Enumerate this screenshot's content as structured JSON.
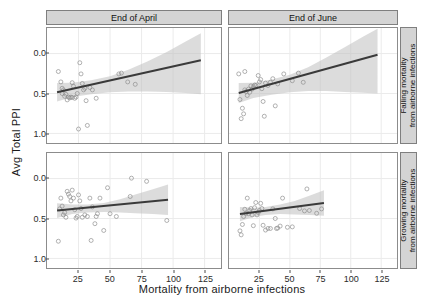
{
  "chart_data": {
    "type": "scatter",
    "title": "",
    "xlabel": "Mortality from airborne infections",
    "ylabel": "Avg Total PPI",
    "xlim": [
      0,
      138
    ],
    "ylim": [
      -0.12,
      1.32
    ],
    "xticks": [
      25,
      50,
      75,
      100,
      125
    ],
    "yticks": [
      "0.0",
      "0.5",
      "1.0"
    ],
    "ytick_values": [
      0.0,
      0.5,
      1.0
    ],
    "grid": true,
    "legend": "none",
    "facet_layout": "2x2",
    "col_facets": [
      "End of April",
      "End of June"
    ],
    "row_facets": [
      "Falling mortality from airborne infections",
      "Growing mortality from airborne infections"
    ],
    "marker": {
      "shape": "circle",
      "color": "#8c8c8c",
      "size": 2,
      "alpha": 0.75
    },
    "fit_line": {
      "color": "#3a3a3a",
      "width": 2,
      "method": "lm"
    },
    "ribbon": {
      "color": "#bfbfbf",
      "alpha": 0.55,
      "label": "95% CI"
    },
    "panels": [
      {
        "id": "april-falling",
        "col": "End of April",
        "row": "Falling mortality from airborne infections",
        "fit": {
          "x0": 8,
          "y0": 0.515,
          "x1": 122,
          "y1": 0.915
        },
        "ci": {
          "x": [
            8,
            20,
            35,
            50,
            65,
            80,
            95,
            110,
            122
          ],
          "lo": [
            0.4,
            0.455,
            0.49,
            0.515,
            0.525,
            0.525,
            0.52,
            0.505,
            0.49
          ],
          "hi": [
            0.63,
            0.635,
            0.665,
            0.715,
            0.8,
            0.905,
            1.02,
            1.15,
            1.255
          ]
        },
        "points": [
          [
            9,
            0.775
          ],
          [
            11,
            0.645
          ],
          [
            12,
            0.565
          ],
          [
            12,
            0.5
          ],
          [
            13,
            0.545
          ],
          [
            14,
            0.465
          ],
          [
            15,
            0.49
          ],
          [
            16,
            0.42
          ],
          [
            17,
            0.455
          ],
          [
            18,
            0.445
          ],
          [
            19,
            0.455
          ],
          [
            20,
            0.45
          ],
          [
            20,
            0.635
          ],
          [
            21,
            0.59
          ],
          [
            22,
            0.44
          ],
          [
            23,
            0.455
          ],
          [
            24,
            0.5
          ],
          [
            25,
            0.055
          ],
          [
            26,
            0.885
          ],
          [
            27,
            0.745
          ],
          [
            28,
            0.625
          ],
          [
            29,
            0.545
          ],
          [
            30,
            0.565
          ],
          [
            31,
            0.41
          ],
          [
            32,
            0.1
          ],
          [
            34,
            0.575
          ],
          [
            36,
            0.545
          ],
          [
            39,
            0.44
          ],
          [
            57,
            0.745
          ],
          [
            59,
            0.755
          ],
          [
            64,
            0.645
          ],
          [
            70,
            0.615
          ]
        ]
      },
      {
        "id": "june-falling",
        "col": "End of June",
        "row": "Falling mortality from airborne infections",
        "fit": {
          "x0": 8,
          "y0": 0.505,
          "x1": 122,
          "y1": 0.985
        },
        "ci": {
          "x": [
            8,
            20,
            35,
            50,
            65,
            80,
            95,
            110,
            122
          ],
          "lo": [
            0.38,
            0.445,
            0.485,
            0.515,
            0.53,
            0.53,
            0.52,
            0.51,
            0.5
          ],
          "hi": [
            0.63,
            0.635,
            0.675,
            0.735,
            0.83,
            0.95,
            1.08,
            1.21,
            1.31
          ]
        },
        "points": [
          [
            9,
            0.425
          ],
          [
            10,
            0.185
          ],
          [
            11,
            0.315
          ],
          [
            12,
            0.245
          ],
          [
            13,
            0.545
          ],
          [
            14,
            0.525
          ],
          [
            15,
            0.475
          ],
          [
            16,
            0.555
          ],
          [
            17,
            0.515
          ],
          [
            18,
            0.595
          ],
          [
            19,
            0.555
          ],
          [
            20,
            0.585
          ],
          [
            21,
            0.605
          ],
          [
            22,
            0.6
          ],
          [
            24,
            0.725
          ],
          [
            25,
            0.645
          ],
          [
            26,
            0.675
          ],
          [
            27,
            0.56
          ],
          [
            28,
            0.4
          ],
          [
            30,
            0.63
          ],
          [
            32,
            0.6
          ],
          [
            34,
            0.64
          ],
          [
            36,
            0.685
          ],
          [
            38,
            0.345
          ],
          [
            40,
            0.62
          ],
          [
            45,
            0.745
          ],
          [
            52,
            0.66
          ],
          [
            57,
            0.755
          ],
          [
            61,
            0.64
          ],
          [
            13,
            0.775
          ],
          [
            8,
            0.745
          ],
          [
            29,
            0.215
          ]
        ]
      },
      {
        "id": "april-growing",
        "col": "End of April",
        "row": "Growing mortality from airborne infections",
        "fit": {
          "x0": 8,
          "y0": 0.6,
          "x1": 96,
          "y1": 0.735
        },
        "ci": {
          "x": [
            8,
            20,
            32,
            45,
            58,
            70,
            84,
            96
          ],
          "lo": [
            0.505,
            0.555,
            0.575,
            0.58,
            0.575,
            0.565,
            0.555,
            0.545
          ],
          "hi": [
            0.69,
            0.675,
            0.675,
            0.695,
            0.74,
            0.8,
            0.865,
            0.925
          ]
        },
        "points": [
          [
            9,
            0.215
          ],
          [
            10,
            0.62
          ],
          [
            11,
            0.755
          ],
          [
            12,
            0.655
          ],
          [
            13,
            0.545
          ],
          [
            14,
            0.575
          ],
          [
            15,
            0.515
          ],
          [
            16,
            0.84
          ],
          [
            17,
            0.805
          ],
          [
            18,
            0.775
          ],
          [
            19,
            0.72
          ],
          [
            20,
            0.855
          ],
          [
            21,
            0.755
          ],
          [
            22,
            0.61
          ],
          [
            23,
            0.505
          ],
          [
            24,
            0.525
          ],
          [
            25,
            0.795
          ],
          [
            26,
            0.72
          ],
          [
            27,
            0.625
          ],
          [
            28,
            0.515
          ],
          [
            30,
            0.545
          ],
          [
            32,
            0.525
          ],
          [
            34,
            0.755
          ],
          [
            35,
            0.225
          ],
          [
            36,
            0.645
          ],
          [
            38,
            0.435
          ],
          [
            39,
            0.525
          ],
          [
            40,
            0.56
          ],
          [
            42,
            0.755
          ],
          [
            45,
            0.35
          ],
          [
            48,
            0.885
          ],
          [
            50,
            0.56
          ],
          [
            55,
            0.525
          ],
          [
            66,
            0.775
          ],
          [
            67,
            1.005
          ],
          [
            79,
            0.965
          ],
          [
            95,
            0.475
          ]
        ]
      },
      {
        "id": "june-growing",
        "col": "End of June",
        "row": "Growing mortality from airborne infections",
        "fit": {
          "x0": 9,
          "y0": 0.555,
          "x1": 78,
          "y1": 0.695
        },
        "ci": {
          "x": [
            9,
            20,
            30,
            42,
            54,
            66,
            78
          ],
          "lo": [
            0.465,
            0.52,
            0.545,
            0.555,
            0.55,
            0.545,
            0.535
          ],
          "hi": [
            0.645,
            0.635,
            0.645,
            0.675,
            0.72,
            0.785,
            0.855
          ]
        },
        "points": [
          [
            9,
            0.345
          ],
          [
            10,
            0.295
          ],
          [
            11,
            0.425
          ],
          [
            12,
            0.525
          ],
          [
            13,
            0.615
          ],
          [
            14,
            0.565
          ],
          [
            15,
            0.755
          ],
          [
            16,
            0.56
          ],
          [
            17,
            0.6
          ],
          [
            18,
            0.625
          ],
          [
            19,
            0.545
          ],
          [
            20,
            0.41
          ],
          [
            21,
            0.635
          ],
          [
            22,
            0.7
          ],
          [
            23,
            0.545
          ],
          [
            24,
            0.575
          ],
          [
            25,
            0.6
          ],
          [
            26,
            0.69
          ],
          [
            27,
            0.625
          ],
          [
            28,
            0.415
          ],
          [
            30,
            0.355
          ],
          [
            32,
            0.375
          ],
          [
            34,
            0.375
          ],
          [
            36,
            0.62
          ],
          [
            38,
            0.5
          ],
          [
            39,
            0.375
          ],
          [
            40,
            0.38
          ],
          [
            42,
            0.405
          ],
          [
            44,
            0.755
          ],
          [
            48,
            0.39
          ],
          [
            52,
            0.395
          ],
          [
            58,
            0.625
          ],
          [
            62,
            0.595
          ],
          [
            64,
            0.87
          ],
          [
            66,
            0.6
          ],
          [
            72,
            0.565
          ],
          [
            76,
            0.62
          ]
        ]
      }
    ]
  },
  "axes": {
    "ylabel": "Avg Total PPI",
    "xlabel": "Mortality from airborne infections",
    "yticks": [
      "1.0",
      "0.5",
      "0.0"
    ],
    "xticks": [
      "25",
      "50",
      "75",
      "100",
      "125"
    ]
  },
  "strips": {
    "col_left": "End of April",
    "col_right": "End of June",
    "row_top_line1": "Falling mortality",
    "row_top_line2": "from airborne infections",
    "row_bottom_line1": "Growing mortality",
    "row_bottom_line2": "from airborne infections"
  },
  "style": {
    "point_color": "#8c8c8c",
    "line_color": "#3a3a3a",
    "ribbon_color": "#bfbfbf",
    "strip_bg": "#d4d4d4",
    "panel_border": "#8c8c8c",
    "grid_color": "#ebebeb"
  }
}
